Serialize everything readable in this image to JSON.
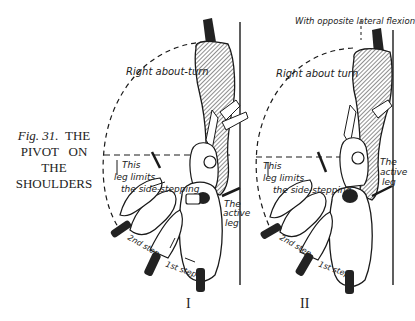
{
  "figure": {
    "caption": {
      "fig_label": "Fig. 31.",
      "line1_suffix": "THE",
      "line2": "PIVOT   ON",
      "line3": "THE",
      "line4": "SHOULDERS"
    },
    "panels": [
      {
        "numeral": "I",
        "labels": {
          "turn": "Right about-turn",
          "limit_line1": "This",
          "limit_line2": "leg limits",
          "limit_line3": "the side-stepping",
          "active_line1": "The",
          "active_line2": "active",
          "active_line3": "leg",
          "step2": "2nd step",
          "step1": "1st step"
        }
      },
      {
        "numeral": "II",
        "labels": {
          "flexion": "With opposite lateral flexion",
          "turn": "Right about turn",
          "limit_line1": "This",
          "limit_line2": "leg limits",
          "limit_line3": "the side-stepping",
          "active_line1": "The",
          "active_line2": "active",
          "active_line3": "leg",
          "step2": "2nd step",
          "step1": "1st step"
        }
      }
    ],
    "colors": {
      "ink": "#1a1a1a",
      "paper": "#ffffff",
      "hatch": "#555555"
    }
  }
}
